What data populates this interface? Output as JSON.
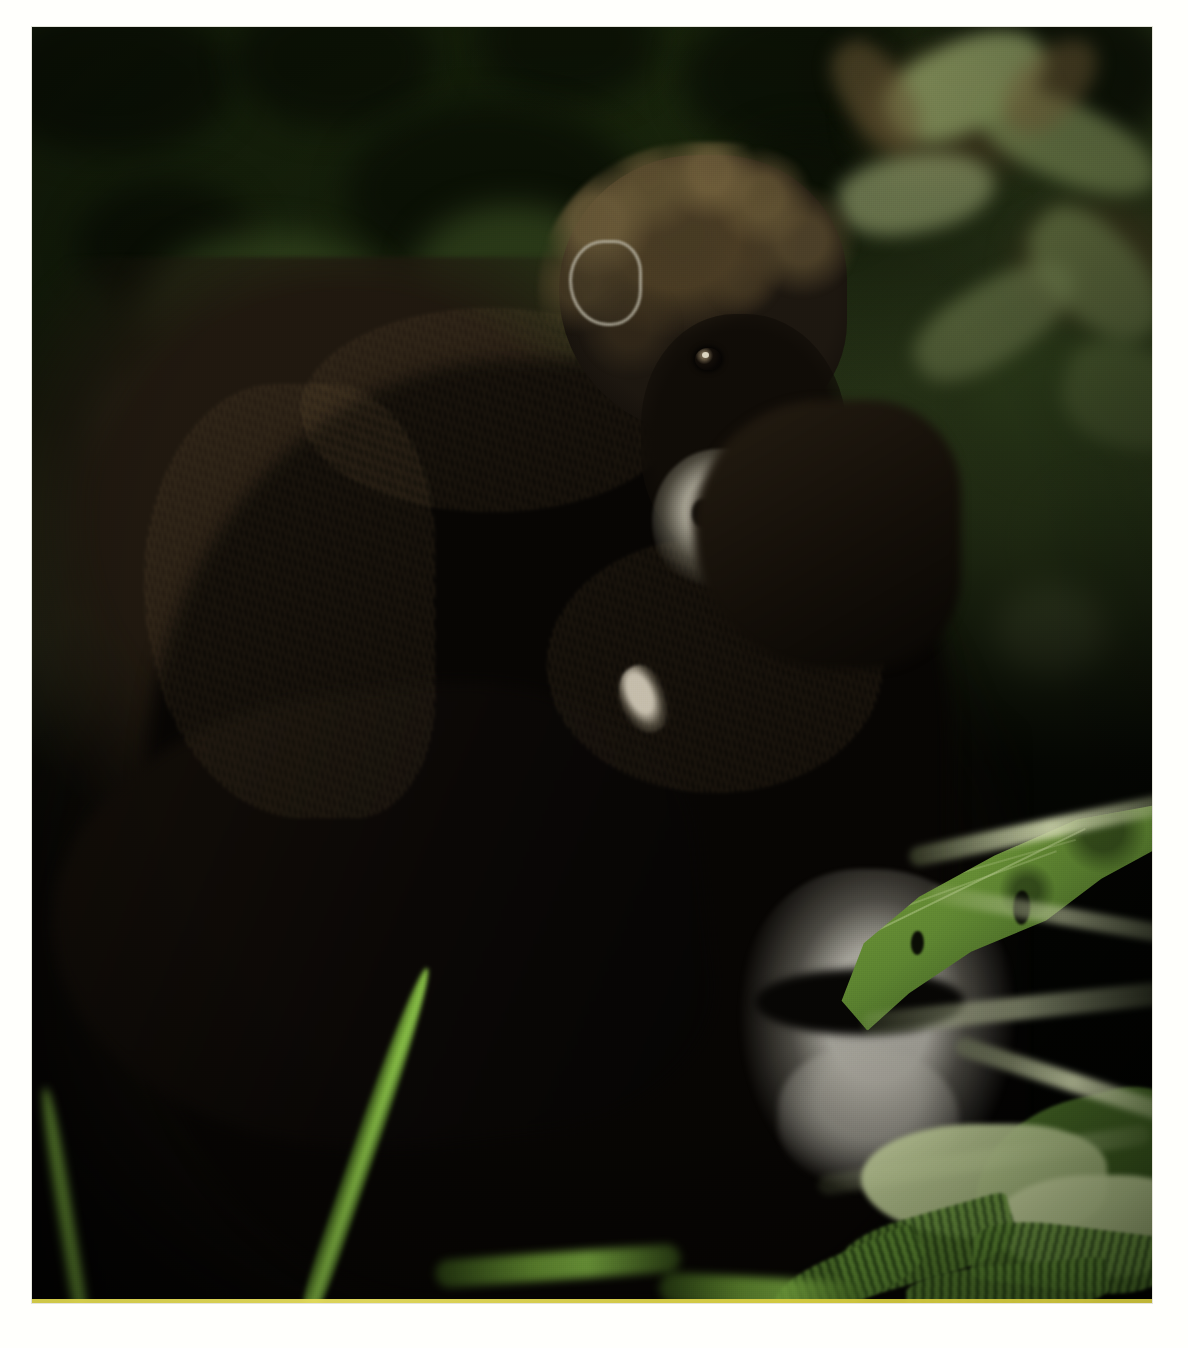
{
  "image": {
    "subject": "Mountain gorilla mother with infant clinging to her back",
    "scene": "Dense green rainforest understory",
    "orientation": "portrait",
    "border_color": "#fffffc",
    "print_edge_color": "#d9d14a",
    "alt_text": "A dark-furred mountain gorilla infant rides on the back of an adult gorilla amid blurred green jungle foliage; a large torn leaf partly covers the adult's pale muzzle."
  },
  "palette": {
    "background_green_light": "#7d9b4e",
    "background_green_mid": "#567236",
    "background_green_dark": "#1a240e",
    "fur_black": "#070503",
    "fur_brown_highlight": "#4a3c24",
    "muzzle_grey": "#b0ac9c",
    "leaf_green": "#6d9438",
    "grass_bright": "#8cc44a",
    "pale_stem": "#d6deb2",
    "shadow_black": "#020301"
  },
  "regions": {
    "background_foliage": "blurred bokeh leaves, upper two thirds",
    "infant": "upper centre-right, face turned toward camera",
    "mother": "large dark mass filling centre and lower-left",
    "mother_face": "lower right, partly hidden by leaf",
    "big_leaf": "torn green leaf, right of centre-lower",
    "grass_blades": "bright green blades, lower centre-left",
    "ferns": "serrated fern and nettle leaves, lower right",
    "dark_understory": "near-black shadow across the bottom"
  },
  "features": {
    "infant_eyes": 2,
    "infant_ear_visible": true,
    "infant_nostrils": 2,
    "visible_finger": true,
    "leaf_holes": 4,
    "grass_blades": 3
  }
}
